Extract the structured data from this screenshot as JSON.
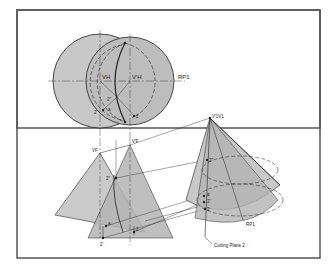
{
  "figure": {
    "type": "orthographic-projection-drawing",
    "colors": {
      "background": "#ffffff",
      "border": "#555555",
      "fill_light": "#c8c8c8",
      "fill_dark": "#b4b4b4",
      "line": "#222222"
    },
    "labels": {
      "top_vertex_left": "VH",
      "top_vertex_right": "V'H",
      "reference_plane_top": "RP1",
      "point_2_double_prime_top": "2\"",
      "point_a_top": "a",
      "point_2_prime_top": "2'",
      "point_2_top": "2",
      "front_vertex_left": "VF",
      "front_vertex_right": "V'F",
      "point_2_double_prime_front": "2\"",
      "point_a_front": "a",
      "point_2_front": "2",
      "point_2_prime_front": "2'",
      "aux_vertex": "V'1V1",
      "point_2_double_prime_aux": "2\"",
      "point_a_aux": "a",
      "point_2_prime_aux": "2'",
      "point_2_aux": "2",
      "reference_plane_aux": "RP1",
      "cutting_plane_label": "Cutting Plane 2"
    }
  }
}
